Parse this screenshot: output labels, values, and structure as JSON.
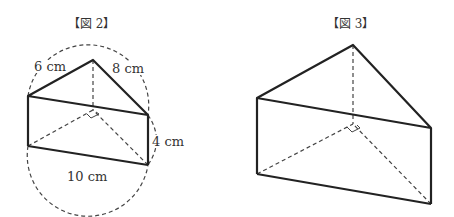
{
  "figure2": {
    "title": "【図 2】",
    "labels": {
      "edge_left": "6 cm",
      "edge_right": "8 cm",
      "height": "4 cm",
      "diameter": "10 cm"
    },
    "vertices": {
      "apex_top": [
        93,
        60
      ],
      "left_top": [
        28,
        96
      ],
      "right_top": [
        148,
        115
      ],
      "left_bottom": [
        28,
        146
      ],
      "right_bottom": [
        148,
        165
      ],
      "apex_bottom": [
        93,
        110
      ]
    }
  },
  "figure3": {
    "title": "【図 3】",
    "vertices": {
      "apex_top": [
        353,
        45
      ],
      "left_top": [
        257,
        98
      ],
      "right_top": [
        431,
        128
      ],
      "left_bottom": [
        257,
        174
      ],
      "right_bottom": [
        431,
        204
      ],
      "apex_bottom": [
        353,
        124
      ]
    }
  },
  "colors": {
    "line": "#222222",
    "dashed": "#444444",
    "background": "#ffffff"
  }
}
